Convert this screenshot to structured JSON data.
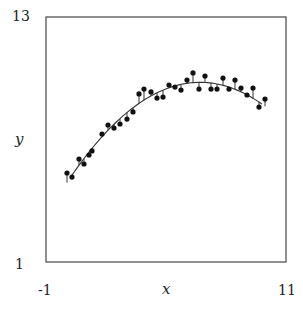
{
  "chart_data": {
    "type": "scatter",
    "title": "",
    "xlabel": "x",
    "ylabel": "y",
    "xlim": [
      -1,
      11
    ],
    "ylim": [
      1,
      13
    ],
    "x_tick_labels": [
      "-1",
      "11"
    ],
    "y_tick_labels": [
      "1",
      "13"
    ],
    "grid": false,
    "legend": null,
    "series": [
      {
        "name": "observations",
        "kind": "scatter",
        "x": [
          0.05,
          0.3,
          0.65,
          0.9,
          1.15,
          1.3,
          1.8,
          2.1,
          2.4,
          2.7,
          3.05,
          3.35,
          3.65,
          3.9,
          4.25,
          4.55,
          4.85,
          5.15,
          5.45,
          5.75,
          6.05,
          6.35,
          6.65,
          6.95,
          7.25,
          7.55,
          7.85,
          8.15,
          8.45,
          8.75,
          9.05,
          9.35,
          9.65,
          9.95
        ],
        "y": [
          5.36,
          5.16,
          6.04,
          5.8,
          6.24,
          6.44,
          7.27,
          7.71,
          7.56,
          7.76,
          8.0,
          8.35,
          9.23,
          9.47,
          9.33,
          9.03,
          9.08,
          9.67,
          9.57,
          9.42,
          9.91,
          10.26,
          9.47,
          10.11,
          9.47,
          9.47,
          10.01,
          9.47,
          9.91,
          9.52,
          9.18,
          9.52,
          8.59,
          8.98
        ]
      },
      {
        "name": "quadratic fit",
        "kind": "line",
        "equation": "y = -0.111 (x - 6.7)^2 + 9.8",
        "x_range": [
          0.3,
          9.8
        ]
      }
    ],
    "annotations": [
      "vertical residual segments from each point to fitted curve"
    ]
  },
  "style": {
    "point_color": "#111111",
    "curve_color": "#333333",
    "frame_color": "#555555"
  },
  "labels": {
    "y_top": "13",
    "y_bottom": "1",
    "x_left": "-1",
    "x_right": "11",
    "x_axis": "x",
    "y_axis": "y"
  }
}
